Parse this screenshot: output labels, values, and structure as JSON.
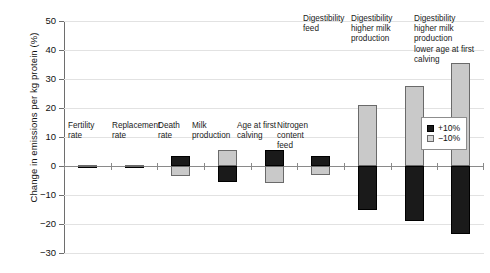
{
  "chart_data": {
    "type": "bar",
    "title": "",
    "subtitle": "",
    "xlabel": "",
    "ylabel": "Change in emissions per kg protein (%)",
    "ylim": [
      -30,
      50
    ],
    "yticks": [
      -30,
      -20,
      -10,
      0,
      10,
      20,
      30,
      40,
      50
    ],
    "ytick_labels": [
      "−30",
      "−20",
      "−10",
      "0",
      "10",
      "20",
      "30",
      "40",
      "50"
    ],
    "grid": "horizontal",
    "legend_position": "right-inside",
    "categories": [
      "Fertility\nrate",
      "Replacement\nrate",
      "Death\nrate",
      "Milk\nproduction",
      "Age at first\ncalving",
      "Nitrogen\ncontent\nfeed",
      "Digestibility\nfeed",
      "Digestibility\nhigher milk\nproduction",
      "Digestibility\nhigher milk production\nlower age at first calving"
    ],
    "series": [
      {
        "name": "+10%",
        "color": "#1a1a1a",
        "values": [
          -0.3,
          -0.3,
          3.5,
          -5.5,
          5.5,
          3.5,
          -15.0,
          -19.0,
          -23.5
        ]
      },
      {
        "name": "−10%",
        "color": "#c9c9c9",
        "values": [
          0.2,
          0.2,
          -3.5,
          5.5,
          -6.0,
          -3.0,
          21.0,
          27.5,
          35.5
        ]
      }
    ],
    "annotations": []
  },
  "legend": {
    "items": [
      {
        "label": "+10%",
        "swatch": "pos"
      },
      {
        "label": "−10%",
        "swatch": "neg"
      }
    ]
  },
  "axis": {
    "y_title": "Change in emissions per kg protein (%)",
    "y_tick_50": "50",
    "y_tick_40": "40",
    "y_tick_30": "30",
    "y_tick_20": "20",
    "y_tick_10": "10",
    "y_tick_0": "0",
    "y_tick_m10": "−10",
    "y_tick_m20": "−20",
    "y_tick_m30": "−30"
  },
  "labels": {
    "cat0": "Fertility\nrate",
    "cat1": "Replacement\nrate",
    "cat2": "Death\nrate",
    "cat3": "Milk\nproduction",
    "cat4": "Age at first\ncalving",
    "cat5": "Nitrogen\ncontent\nfeed",
    "cat6": "Digestibility\nfeed",
    "cat7": "Digestibility\nhigher milk\nproduction",
    "cat8": "Digestibility\nhigher milk production\nlower age at first calving"
  }
}
